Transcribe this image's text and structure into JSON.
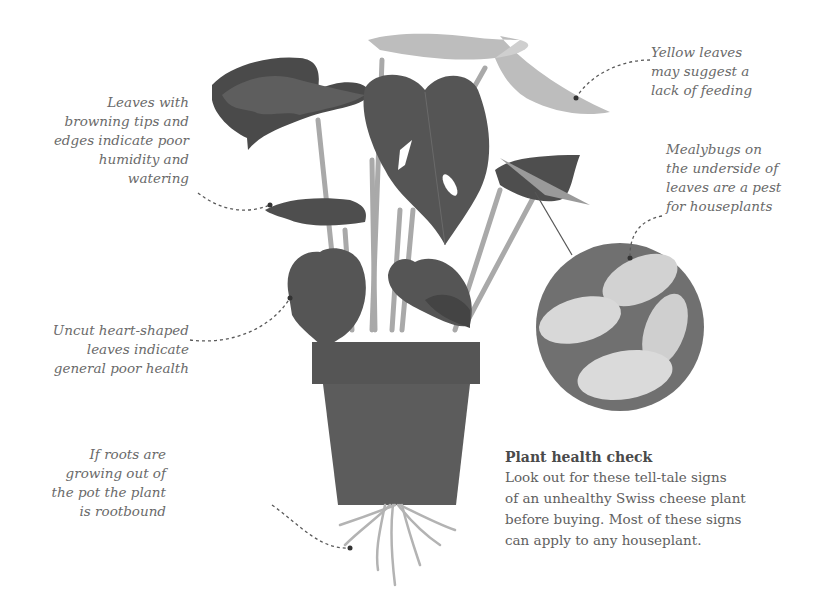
{
  "callouts": {
    "browning": {
      "lines": [
        "Leaves with",
        "browning tips and",
        "edges indicate poor",
        "humidity and",
        "watering"
      ]
    },
    "yellow": {
      "lines": [
        "Yellow leaves",
        "may suggest a",
        "lack of feeding"
      ]
    },
    "mealybugs": {
      "lines": [
        "Mealybugs on",
        "the underside of",
        "leaves are a pest",
        "for houseplants"
      ]
    },
    "uncut": {
      "lines": [
        "Uncut heart-shaped",
        "leaves indicate",
        "general poor health"
      ]
    },
    "roots": {
      "lines": [
        "If roots are",
        "growing out of",
        "the pot the plant",
        "is rootbound"
      ]
    }
  },
  "info_box": {
    "title": "Plant health check",
    "lines": [
      "Look out for these tell-tale signs",
      "of an unhealthy Swiss cheese plant",
      "before buying. Most of these signs",
      "can apply to any houseplant."
    ]
  },
  "colors": {
    "leaf_dark": "#4e4e4e",
    "leaf_mid": "#5e5e5e",
    "leaf_yellow": "#bdbdbd",
    "stem": "#a8a8a8",
    "pot_rim": "#555555",
    "pot_body": "#5c5c5c",
    "roots": "#b3b3b3",
    "text": "#6a6a6a"
  }
}
